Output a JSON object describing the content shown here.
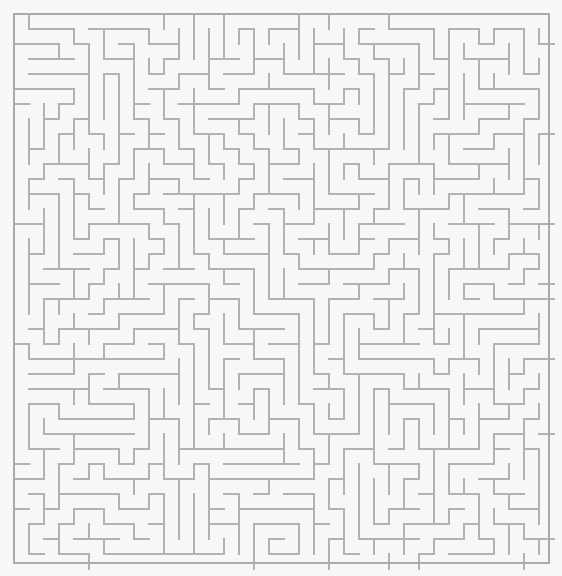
{
  "page": {
    "background_color": "#f8f8f6",
    "width": 562,
    "height": 576
  },
  "maze": {
    "name": "rectangular-perfect-maze",
    "wall_color": "#b3b3b3",
    "border_color": "#ababab",
    "background_color": "#f8f8f6",
    "wall_thickness": 1.6,
    "cell_size": 15,
    "columns": 36,
    "rows": 37,
    "origin_x": 14,
    "origin_y": 14,
    "grid_width": 540,
    "grid_height": 555,
    "entrance": "none-visible",
    "exit": "none-visible",
    "seed": 20240617,
    "generator": "randomized-depth-first",
    "border_closed": true
  }
}
